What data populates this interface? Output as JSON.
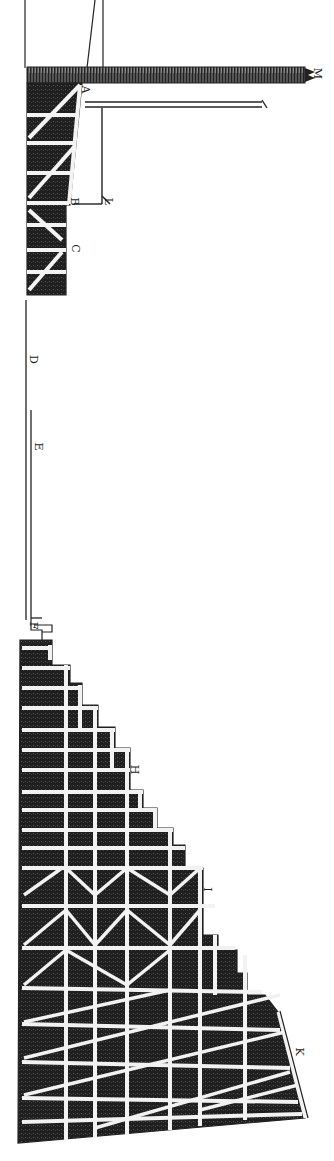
{
  "figure": {
    "kind": "engraving",
    "orientation": "rotated-clockwise",
    "ink_color": "#1a1a1a",
    "paper_color": "#ffffff"
  },
  "labels": {
    "A": "A",
    "B": "B",
    "C": "C",
    "D": "D",
    "E": "E",
    "F": "F",
    "H": "H",
    "I": "I",
    "K": "K",
    "L": "L",
    "M": "M"
  }
}
